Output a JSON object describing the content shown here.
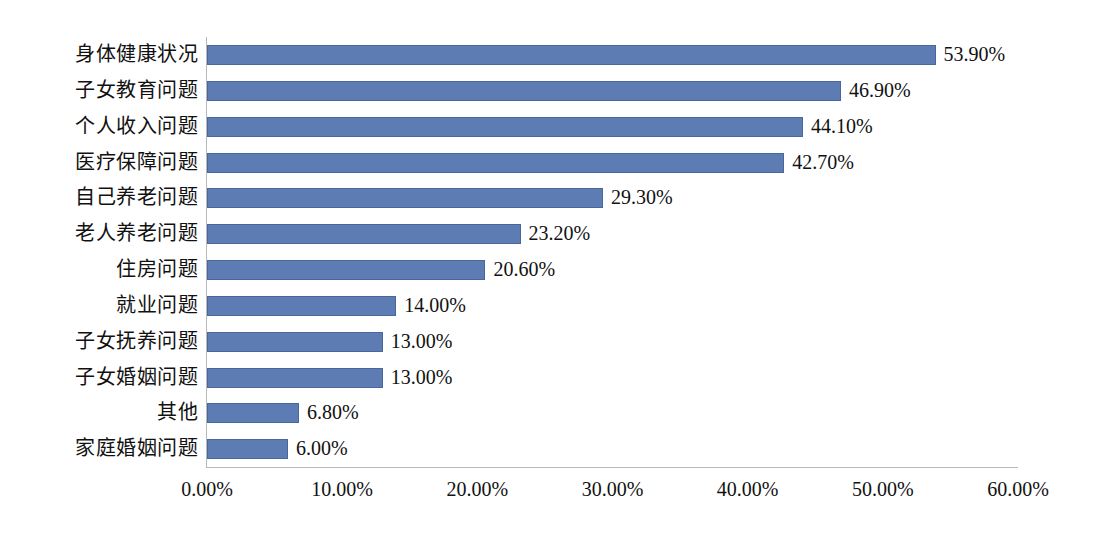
{
  "chart_data": {
    "type": "bar",
    "orientation": "horizontal",
    "title": "",
    "subtitle": "",
    "xlabel": "",
    "ylabel": "",
    "xlim": [
      0,
      60
    ],
    "xtick_labels": [
      "0.00%",
      "10.00%",
      "20.00%",
      "30.00%",
      "40.00%",
      "50.00%",
      "60.00%"
    ],
    "xticks": [
      0,
      10,
      20,
      30,
      40,
      50,
      60
    ],
    "grid": false,
    "legend": "none",
    "bar_color": "#5e7cb4",
    "bar_border_color": "#4a679c",
    "axis_color": "#b9b9b9",
    "categories": [
      "身体健康状况",
      "子女教育问题",
      "个人收入问题",
      "医疗保障问题",
      "自己养老问题",
      "老人养老问题",
      "住房问题",
      "就业问题",
      "子女抚养问题",
      "子女婚姻问题",
      "其他",
      "家庭婚姻问题"
    ],
    "values": [
      53.9,
      46.9,
      44.1,
      42.7,
      29.3,
      23.2,
      20.6,
      14.0,
      13.0,
      13.0,
      6.8,
      6.0
    ],
    "value_labels": [
      "53.90%",
      "46.90%",
      "44.10%",
      "42.70%",
      "29.30%",
      "23.20%",
      "20.60%",
      "14.00%",
      "13.00%",
      "13.00%",
      "6.80%",
      "6.00%"
    ]
  }
}
